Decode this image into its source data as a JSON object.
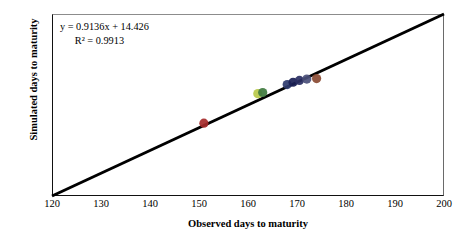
{
  "chart_data": {
    "type": "scatter",
    "title": "",
    "xlabel": "Observed days to maturity",
    "ylabel": "Simulated days to maturity",
    "xlim": [
      120,
      200
    ],
    "ylim": [
      120,
      200
    ],
    "xticks": [
      120,
      130,
      140,
      150,
      160,
      170,
      180,
      190,
      200
    ],
    "yticks": [
      120,
      130,
      140,
      150,
      160,
      170,
      180,
      190,
      200
    ],
    "grid": false,
    "legend": "none",
    "annotations": {
      "equation": "y = 0.9136x + 14.426",
      "r_squared": "R² = 0.9913",
      "slope": 0.9136,
      "intercept": 14.426,
      "r2": 0.9913
    },
    "reference_line": {
      "name": "1:1 line",
      "from": [
        120,
        120
      ],
      "to": [
        200,
        200
      ],
      "color": "#000000"
    },
    "points": [
      {
        "x": 151,
        "y": 152,
        "color": "#a52a2a"
      },
      {
        "x": 162,
        "y": 165,
        "color": "#b8c94a"
      },
      {
        "x": 163,
        "y": 165.5,
        "color": "#3f7a3f"
      },
      {
        "x": 168,
        "y": 169,
        "color": "#2e3b6e"
      },
      {
        "x": 169.2,
        "y": 170,
        "color": "#1a1f55"
      },
      {
        "x": 170.5,
        "y": 170.8,
        "color": "#2a2f63"
      },
      {
        "x": 172,
        "y": 171.4,
        "color": "#4a4f7a"
      },
      {
        "x": 174,
        "y": 171.6,
        "color": "#8a4a32"
      }
    ]
  },
  "axes": {
    "x_title": "Observed days to maturity",
    "y_title": "Simulated days to maturity",
    "x_tick_labels": [
      "120",
      "130",
      "140",
      "150",
      "160",
      "170",
      "180",
      "190",
      "200"
    ],
    "y_tick_labels": [
      "200",
      "190",
      "180",
      "170",
      "160",
      "150",
      "140",
      "130",
      "120"
    ]
  },
  "annotation": {
    "equation": "y = 0.9136x + 14.426",
    "r_squared": "R² = 0.9913"
  },
  "colors": {
    "line": "#000000",
    "frame": "#111111",
    "text": "#000000",
    "background": "#ffffff"
  }
}
